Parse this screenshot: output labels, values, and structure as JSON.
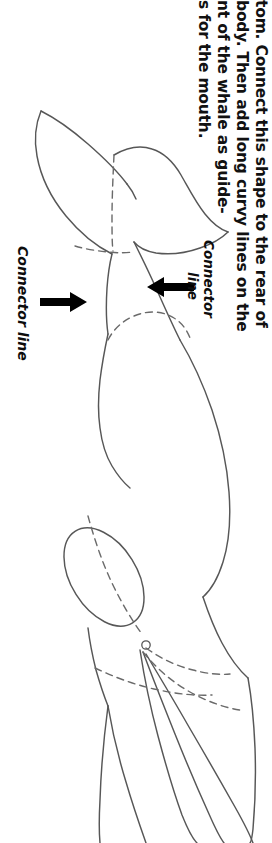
{
  "page": {
    "background_color": "#ffffff",
    "ink_color": "#575757",
    "text_color": "#111111",
    "orientation": "rotated-90-clockwise"
  },
  "instructions": {
    "lines": [
      "tom. Connect this shape to the rear of",
      "body. Then add long curvy lines on the",
      "nt of the whale as guide-",
      "s for the mouth."
    ]
  },
  "callouts": [
    {
      "id": "connector-line-left",
      "label": "Connector line",
      "arrow_direction": "right"
    },
    {
      "id": "connector-line-right",
      "label_line_1": "Connector",
      "label_line_2": "line",
      "arrow_direction": "left"
    }
  ],
  "figure": {
    "subject": "whale",
    "style": "line-drawing",
    "features": [
      "tail-fluke",
      "dorsal-body",
      "flipper",
      "eye",
      "mouth-guide-lines",
      "connector-dashed-lines"
    ]
  }
}
